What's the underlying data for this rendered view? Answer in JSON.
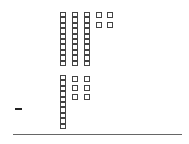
{
  "problem": {
    "operation": "subtraction",
    "operator_symbol": "-",
    "minuend": {
      "value": 34,
      "tens": 3,
      "ones": 4
    },
    "subtrahend": {
      "value": 16,
      "tens": 1,
      "ones": 6
    }
  },
  "colors": {
    "block_border": "#444444",
    "background": "#ffffff",
    "rule": "#666666"
  },
  "layout": {
    "unit_size": 5.4,
    "top_rods_x": [
      60,
      72,
      84
    ],
    "top_rods_y": 12,
    "top_ones": [
      [
        96,
        12
      ],
      [
        107,
        12
      ],
      [
        96,
        22
      ],
      [
        107,
        22
      ]
    ],
    "bottom_rods_x": [
      60
    ],
    "bottom_rods_y": 75,
    "bottom_ones": [
      [
        72,
        76
      ],
      [
        84,
        76
      ],
      [
        72,
        85
      ],
      [
        84,
        85
      ],
      [
        72,
        94
      ],
      [
        84,
        94
      ]
    ]
  }
}
